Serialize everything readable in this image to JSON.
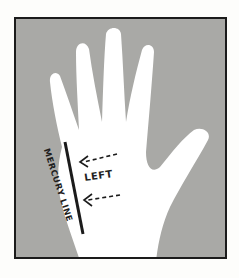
{
  "figure": {
    "hand_side_label": "LEFT",
    "line_label": "MERCURY LINE",
    "colors": {
      "background": "#a9a9a6",
      "hand": "#ffffff",
      "ink": "#1b1b1b"
    }
  }
}
